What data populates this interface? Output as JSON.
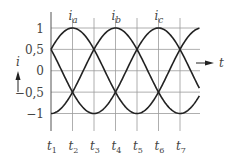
{
  "chart_data": {
    "type": "line",
    "title": "",
    "xlabel": "t",
    "ylabel": "i",
    "x_tick_labels": [
      "t1",
      "t2",
      "t3",
      "t4",
      "t5",
      "t6",
      "t7"
    ],
    "y_tick_labels": [
      "1",
      "0.5",
      "0",
      "-0.5",
      "-1"
    ],
    "y_ticks": [
      1,
      0.5,
      0,
      -0.5,
      -1
    ],
    "ylim": [
      -1,
      1
    ],
    "grid": true,
    "legend": "inline labels above peaks",
    "series": [
      {
        "name": "i_a",
        "phase_deg": 60,
        "peak_at": "t2",
        "values_at_ticks": [
          0.5,
          1,
          0.5,
          -0.5,
          -1,
          -0.5,
          0.5
        ]
      },
      {
        "name": "i_b",
        "phase_deg": 180,
        "peak_at": "t4",
        "values_at_ticks": [
          -1,
          -0.5,
          0.5,
          1,
          0.5,
          -0.5,
          -1
        ]
      },
      {
        "name": "i_c",
        "phase_deg": 300,
        "peak_at": "t6",
        "values_at_ticks": [
          0.5,
          -0.5,
          -1,
          -0.5,
          0.5,
          1,
          0.5
        ]
      }
    ],
    "series_labels": {
      "a": "i",
      "a_sub": "a",
      "b": "i",
      "b_sub": "b",
      "c": "i",
      "c_sub": "c"
    },
    "x_tick_sub": [
      "1",
      "2",
      "3",
      "4",
      "5",
      "6",
      "7"
    ],
    "x_tick_main": "t",
    "y_axis_label": "i",
    "x_axis_label": "t"
  }
}
